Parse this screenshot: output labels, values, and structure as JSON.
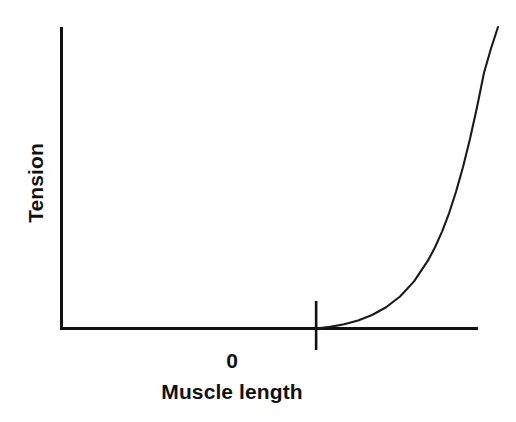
{
  "chart_data": {
    "type": "line",
    "title": "",
    "subtitle": "",
    "xlabel": "Muscle length",
    "ylabel": "Tension",
    "grid": false,
    "legend": null,
    "legend_position": "none",
    "line_color": "#1a1a1a",
    "axis_color": "#111111",
    "background_color": "#ffffff",
    "xlim": [
      -1.82,
      1.3
    ],
    "ylim": [
      0,
      1.12
    ],
    "x_tick_labels": [
      "0"
    ],
    "x_tick_values": [
      0
    ],
    "y_tick_labels": [],
    "y_tick_values": [],
    "annotations": [],
    "series": [
      {
        "name": "Passive tension",
        "description": "Tension rises exponentially once muscle length exceeds 0; zero below 0.",
        "x": [
          0.0,
          0.1,
          0.2,
          0.3,
          0.4,
          0.5,
          0.6,
          0.7,
          0.8,
          0.85,
          0.9,
          0.95,
          1.0,
          1.05,
          1.1,
          1.15,
          1.2,
          1.25,
          1.3
        ],
        "values": [
          0.0,
          0.006,
          0.016,
          0.03,
          0.05,
          0.079,
          0.119,
          0.175,
          0.253,
          0.302,
          0.36,
          0.428,
          0.508,
          0.6,
          0.705,
          0.822,
          0.95,
          1.04,
          1.12
        ]
      }
    ]
  },
  "figure": {
    "y_axis_label": "Tension",
    "x_axis_label": "Muscle length",
    "origin_tick_label": "0"
  }
}
